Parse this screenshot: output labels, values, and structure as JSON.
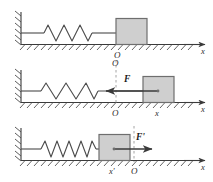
{
  "figure": {
    "axis_label": "x",
    "origin_label": "O"
  },
  "colors": {
    "line": "#3a3a3a",
    "block_fill": "#cfcfcf",
    "block_stroke": "#6e6e6e",
    "spring": "#4a4a4a",
    "hatch": "#4a4a4a",
    "dashed": "#9a9a9a",
    "arrow": "#3a3a3a",
    "label": "#2b2b2b"
  },
  "panels": [
    {
      "id": "panel-equilibrium",
      "state": "natural-length",
      "spring_coils": 4,
      "spring_stretch": "natural",
      "block_position_label": "O",
      "axis_label": "x",
      "force": null,
      "force_label": "",
      "force_direction": "none",
      "origin_top_label": "",
      "origin_bottom_label": "O",
      "position_label": ""
    },
    {
      "id": "panel-stretched",
      "state": "stretched",
      "spring_coils": 4,
      "spring_stretch": "stretched",
      "block_position_label": "x",
      "axis_label": "x",
      "force": "F",
      "force_label": "F",
      "force_direction": "left",
      "origin_top_label": "O",
      "origin_bottom_label": "O",
      "position_label": "x"
    },
    {
      "id": "panel-compressed",
      "state": "compressed",
      "spring_coils": 6,
      "spring_stretch": "compressed",
      "block_position_label": "x'",
      "axis_label": "x",
      "force": "F'",
      "force_label": "F'",
      "force_direction": "right",
      "origin_top_label": "",
      "origin_bottom_label": "O",
      "position_label": "x'"
    }
  ]
}
